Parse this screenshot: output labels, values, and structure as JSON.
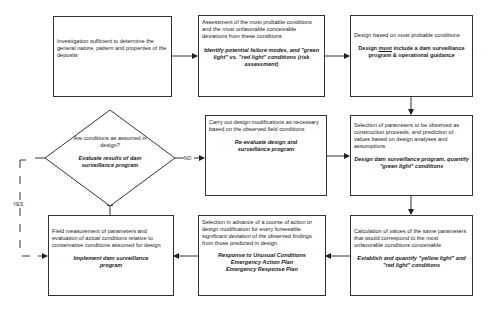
{
  "diagram": {
    "type": "flowchart",
    "nodes": {
      "investigation": {
        "text": "Investigation sufficient to determine the general nature, pattern and properties of the deposits"
      },
      "assessment": {
        "text": "Assessment of the most probable conditions and the most unfavorable conceivable deviations from these conditions",
        "emphasis": "Identify potential failure modes, and \"green light\" vs. \"red light\" conditions (risk assessment)"
      },
      "design": {
        "text": "Design based on most probable conditions",
        "emphasis_pre": "Design ",
        "emphasis_underlined": "must",
        "emphasis_post": " include a dam surveillance program & operational guidance"
      },
      "decision": {
        "question": "Are conditions as assumed in design?",
        "emphasis": "Evaluate results of dam surveillance program"
      },
      "modifications": {
        "text": "Carry out design modifications as necessary based on the observed field conditions",
        "emphasis": "Re-evaluate design and surveillance program"
      },
      "parameters": {
        "text": "Selection of parameters to be observed as construction proceeds, and prediction of values based on design analyses and assumptions",
        "emphasis": "Design dam surveillance program, quantify \"green light\" conditions"
      },
      "field_measurement": {
        "text": "Field measurement of parameters and evaluation of actual conditions relative to conservative conditions assumed for design",
        "emphasis": "Implement dam surveillance program"
      },
      "response": {
        "text": "Selection in advance of a course of action or design modification for every forseeable significant deviation of the observed findings from those predicted in design",
        "emphasis_lines": [
          "Response to Unusual Conditions",
          "Emergency Action Plan",
          "Emergency Response Plan"
        ]
      },
      "calculation": {
        "text": "Calculation of values of the same parameters that would correspond to the most unfavorable conditions conceivable",
        "emphasis": "Establish and quantify \"yellow light\" and \"red light\" conditions"
      }
    },
    "edge_labels": {
      "no": "NO",
      "yes": "YES"
    },
    "colors": {
      "line": "#333333",
      "background": "#ffffff",
      "text": "#1a1a1a"
    }
  }
}
